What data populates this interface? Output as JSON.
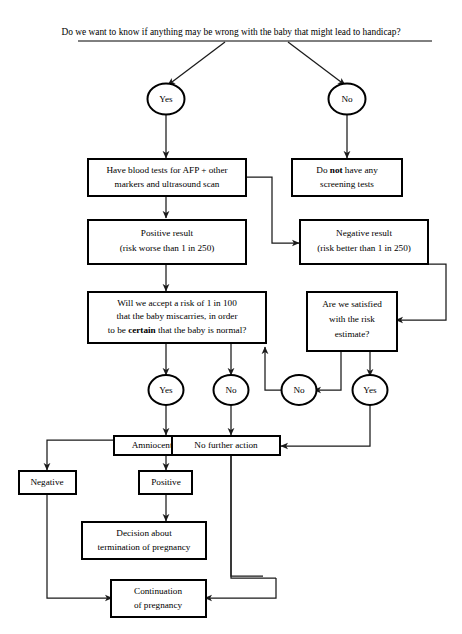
{
  "diagram": {
    "title": "Do we want to know if anything may be wrong with the baby that might lead to handicap?",
    "nodes": {
      "q_root": {
        "label": "Do we want to know if anything may be wrong with the baby that might lead to handicap?",
        "shape": "text"
      },
      "yes_top": {
        "label": "Yes",
        "shape": "oval"
      },
      "no_top": {
        "label": "No",
        "shape": "oval"
      },
      "blood_tests": {
        "line1": "Have blood tests for AFP + other",
        "line2": "markers and ultrasound scan",
        "shape": "box"
      },
      "no_screening": {
        "line1_a": "Do ",
        "line1_b": "not",
        "line1_c": " have any",
        "line2": "screening tests",
        "shape": "box"
      },
      "positive_result": {
        "line1": "Positive result",
        "line2": "(risk worse than 1 in 250)",
        "shape": "box"
      },
      "negative_result": {
        "line1": "Negative result",
        "line2": "(risk better than 1 in 250)",
        "shape": "box"
      },
      "accept_risk": {
        "line1": "Will we accept a risk of 1 in 100",
        "line2": "that the baby miscarries, in order",
        "line3_a": "to be ",
        "line3_b": "certain",
        "line3_c": " that the baby is normal?",
        "shape": "box"
      },
      "satisfied": {
        "line1": "Are we satisfied",
        "line2": "with the risk",
        "line3": "estimate?",
        "shape": "box"
      },
      "yes_mid_left": {
        "label": "Yes",
        "shape": "oval"
      },
      "no_mid_left": {
        "label": "No",
        "shape": "oval"
      },
      "no_mid_right": {
        "label": "No",
        "shape": "oval"
      },
      "yes_mid_right": {
        "label": "Yes",
        "shape": "oval"
      },
      "amniocentesis": {
        "label": "Amniocentesis",
        "shape": "box"
      },
      "no_further_action": {
        "label": "No further action",
        "shape": "box"
      },
      "amnio_negative": {
        "label": "Negative",
        "shape": "box"
      },
      "amnio_positive": {
        "label": "Positive",
        "shape": "box"
      },
      "termination_decision": {
        "line1": "Decision about",
        "line2": "termination of pregnancy",
        "shape": "box"
      },
      "continuation": {
        "line1": "Continuation",
        "line2": "of pregnancy",
        "shape": "box"
      }
    },
    "colors": {
      "line": "#1a1a1a",
      "box_border": "#000000",
      "background": "#ffffff",
      "text": "#000000"
    }
  }
}
